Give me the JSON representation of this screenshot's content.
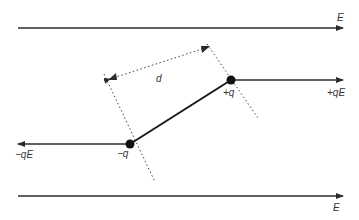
{
  "diagram": {
    "field_lines": [
      {
        "id": "top",
        "label": "E",
        "y": 28,
        "x1": 18,
        "x2": 343,
        "label_x": 337,
        "label_y": 21
      },
      {
        "id": "bottom",
        "label": "E",
        "y": 196,
        "x1": 18,
        "x2": 343,
        "label_x": 333,
        "label_y": 211
      }
    ],
    "charges": {
      "positive": {
        "label": "+q",
        "x": 231,
        "y": 80,
        "label_x": 223,
        "label_y": 96
      },
      "negative": {
        "label": "−q",
        "x": 130,
        "y": 144,
        "label_x": 117,
        "label_y": 157
      }
    },
    "forces": {
      "positive": {
        "label": "+qE",
        "x1": 231,
        "x2": 343,
        "y": 80,
        "label_x": 327,
        "label_y": 96
      },
      "negative": {
        "label": "−qE",
        "x1": 130,
        "x2": 18,
        "y": 144,
        "label_x": 15,
        "label_y": 158
      }
    },
    "separation": {
      "label": "d",
      "label_x": 156,
      "label_y": 82
    },
    "colors": {
      "line": "#2b2b2b",
      "dot": "#111111",
      "text": "#333333",
      "background": "#ffffff"
    }
  }
}
